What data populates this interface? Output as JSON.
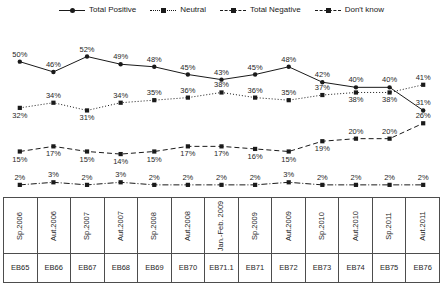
{
  "chart_data": {
    "type": "line",
    "title": "",
    "xlabel": "",
    "ylabel": "",
    "ylim": [
      0,
      60
    ],
    "grid": false,
    "legend_position": "top-center",
    "categories": [
      "Sp.2006",
      "Aut.2006",
      "Sp.2007",
      "Aut.2007",
      "Sp.2008",
      "Aut.2008",
      "Jan.-Feb.2009",
      "Sp.2009",
      "Aut.2009",
      "Sp.2010",
      "Aut.2010",
      "Sp.2011",
      "Aut.2011"
    ],
    "survey_codes": [
      "EB65",
      "EB66",
      "EB67",
      "EB68",
      "EB69",
      "EB70",
      "EB71.1",
      "EB71",
      "EB72",
      "EB73",
      "EB74",
      "EB75",
      "EB76"
    ],
    "series": [
      {
        "name": "Total Positive",
        "style": "solid",
        "marker": "circle",
        "values": [
          50,
          46,
          52,
          49,
          48,
          45,
          43,
          45,
          48,
          42,
          40,
          40,
          31
        ],
        "labels": [
          "50%",
          "46%",
          "52%",
          "49%",
          "48%",
          "45%",
          "43%",
          "45%",
          "48%",
          "42%",
          "40%",
          "40%",
          "31%"
        ]
      },
      {
        "name": "Neutral",
        "style": "dotted",
        "marker": "square",
        "values": [
          32,
          34,
          31,
          34,
          35,
          36,
          38,
          36,
          35,
          37,
          38,
          38,
          41
        ],
        "labels": [
          "32%",
          "34%",
          "31%",
          "34%",
          "35%",
          "36%",
          "38%",
          "36%",
          "35%",
          "37%",
          "38%",
          "38%",
          "41%"
        ]
      },
      {
        "name": "Total Negative",
        "style": "dashed",
        "marker": "square",
        "values": [
          15,
          17,
          15,
          14,
          15,
          17,
          17,
          16,
          15,
          19,
          20,
          20,
          26
        ],
        "labels": [
          "15%",
          "17%",
          "15%",
          "14%",
          "15%",
          "17%",
          "17%",
          "16%",
          "15%",
          "19%",
          "20%",
          "20%",
          "26%"
        ]
      },
      {
        "name": "Don't know",
        "style": "dashdot",
        "marker": "square",
        "values": [
          2,
          3,
          2,
          3,
          2,
          2,
          2,
          2,
          3,
          2,
          2,
          2,
          2
        ],
        "labels": [
          "2%",
          "3%",
          "2%",
          "3%",
          "2%",
          "2%",
          "2%",
          "2%",
          "3%",
          "2%",
          "2%",
          "2%",
          "2%"
        ]
      }
    ]
  },
  "legend": {
    "items": [
      {
        "label": "Total Positive",
        "style": "solid",
        "marker": "circle"
      },
      {
        "label": "Neutral",
        "style": "dotted",
        "marker": "square"
      },
      {
        "label": "Total Negative",
        "style": "dashdot",
        "marker": "square"
      },
      {
        "label": "Don't know",
        "style": "dashdot",
        "marker": "square"
      }
    ]
  },
  "axis_table": {
    "period_row": [
      "Sp.2006",
      "Aut.2006",
      "Sp.2007",
      "Aut.2007",
      "Sp.2008",
      "Aut.2008",
      "Jan.-Feb. 2009",
      "Sp.2009",
      "Aut.2009",
      "Sp.2010",
      "Aut.2010",
      "Sp.2011",
      "Aut.2011"
    ],
    "code_row": [
      "EB65",
      "EB66",
      "EB67",
      "EB68",
      "EB69",
      "EB70",
      "EB71.1",
      "EB71",
      "EB72",
      "EB73",
      "EB74",
      "EB75",
      "EB76"
    ]
  },
  "colors": {
    "line": "#1a1a1a",
    "text": "#262626",
    "border": "#4d4d4d",
    "background": "#ffffff"
  }
}
